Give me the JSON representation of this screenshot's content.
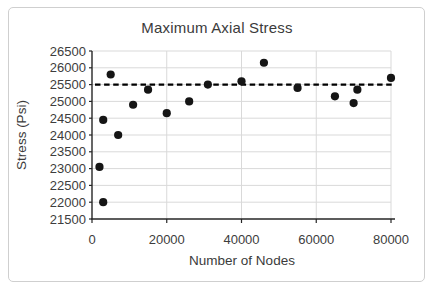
{
  "chart_title": "Maximum Axial Stress",
  "chart_data": {
    "type": "scatter",
    "title": "Maximum Axial Stress",
    "xlabel": "Number of Nodes",
    "ylabel": "Stress (Psi)",
    "xlim": [
      0,
      80000
    ],
    "ylim": [
      21500,
      26500
    ],
    "x_ticks": [
      0,
      20000,
      40000,
      60000,
      80000
    ],
    "y_ticks": [
      21500,
      22000,
      22500,
      23000,
      23500,
      24000,
      24500,
      25000,
      25500,
      26000,
      26500
    ],
    "grid": true,
    "legend": false,
    "series": [
      {
        "name": "maximum-axial-stress",
        "marker": "circle",
        "color": "#151515",
        "points": [
          {
            "x": 2000,
            "y": 23050
          },
          {
            "x": 3000,
            "y": 24450
          },
          {
            "x": 3000,
            "y": 22000
          },
          {
            "x": 5000,
            "y": 25800
          },
          {
            "x": 7000,
            "y": 24000
          },
          {
            "x": 11000,
            "y": 24900
          },
          {
            "x": 15000,
            "y": 25350
          },
          {
            "x": 20000,
            "y": 24650
          },
          {
            "x": 26000,
            "y": 25000
          },
          {
            "x": 31000,
            "y": 25500
          },
          {
            "x": 40000,
            "y": 25600
          },
          {
            "x": 46000,
            "y": 26150
          },
          {
            "x": 55000,
            "y": 25400
          },
          {
            "x": 65000,
            "y": 25150
          },
          {
            "x": 70000,
            "y": 24950
          },
          {
            "x": 71000,
            "y": 25350
          },
          {
            "x": 80000,
            "y": 25700
          }
        ]
      }
    ],
    "reference_line": {
      "y": 25500,
      "style": "dashed",
      "color": "#000000"
    }
  },
  "colors": {
    "background": "#ffffff",
    "frame_border": "#cfcfcf",
    "gridline": "#d9d9d9",
    "axis": "#262626",
    "text": "#3b3b3b",
    "marker": "#151515",
    "reference": "#000000"
  }
}
